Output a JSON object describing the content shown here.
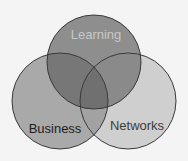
{
  "diagram": {
    "type": "venn",
    "sets": [
      {
        "label": "Learning",
        "fill": "#8c8c8c",
        "text_color": "#c8c8c8"
      },
      {
        "label": "Business",
        "fill": "#a6a6a6",
        "text_color": "#1e1e1e"
      },
      {
        "label": "Networks",
        "fill": "#cfcfcf",
        "text_color": "#3c3c3c"
      }
    ],
    "background": "#f4f4f4",
    "stroke": "#3a3a3a"
  }
}
